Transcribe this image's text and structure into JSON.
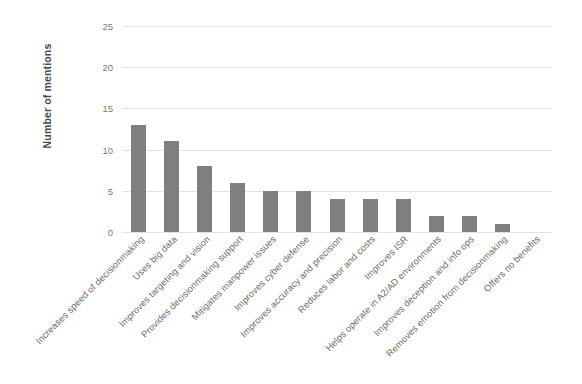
{
  "chart_data": {
    "type": "bar",
    "title": "",
    "xlabel": "",
    "ylabel": "Number of mentions",
    "ylim": [
      0,
      25
    ],
    "yticks": [
      0,
      5,
      10,
      15,
      20,
      25
    ],
    "grid": true,
    "legend": "none",
    "bar_color": "#7f7f7f",
    "gridline_color": "#e2e2e2",
    "categories": [
      "Increases speed of decisionmaking",
      "Uses big data",
      "Improves targeting and vision",
      "Provides decisionmaking support",
      "Mitigates manpower issues",
      "Improves cyber defense",
      "Improves accuracy and precision",
      "Reduces labor and costs",
      "Improves ISR",
      "Helps operate in A2/AD environments",
      "Improves deception and info ops",
      "Removes emotion from decisionmaking",
      "Offers no benefits"
    ],
    "values": [
      13,
      11,
      8,
      6,
      5,
      5,
      4,
      4,
      4,
      2,
      2,
      1,
      0
    ]
  }
}
